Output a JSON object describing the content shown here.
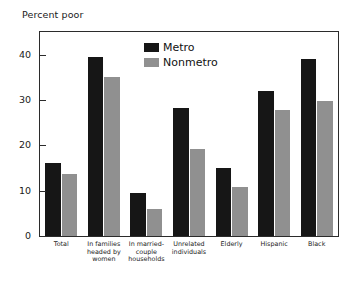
{
  "chart_data": {
    "type": "bar",
    "title": "Percent poor",
    "xlabel": "",
    "ylabel": "",
    "ylim": [
      0,
      45
    ],
    "yticks": [
      0,
      10,
      20,
      30,
      40
    ],
    "ytick_labels": [
      "0",
      "10",
      "20",
      "30",
      "40"
    ],
    "grid": false,
    "legend_position": "top-center",
    "categories": [
      "Total",
      "In families headed by women",
      "In married-couple households",
      "Unrelated individuals",
      "Elderly",
      "Hispanic",
      "Black"
    ],
    "category_lines": [
      [
        "Total"
      ],
      [
        "In families",
        "headed by",
        "women"
      ],
      [
        "In married-",
        "couple",
        "households"
      ],
      [
        "Unrelated",
        "individuals"
      ],
      [
        "Elderly"
      ],
      [
        "Hispanic"
      ],
      [
        "Black"
      ]
    ],
    "series": [
      {
        "name": "Metro",
        "color": "#161616",
        "values": [
          16.1,
          39.5,
          9.5,
          28.3,
          15.0,
          32.0,
          39.1
        ]
      },
      {
        "name": "Nonmetro",
        "color": "#909090",
        "values": [
          13.7,
          35.1,
          6.0,
          19.3,
          10.8,
          27.8,
          29.8
        ]
      }
    ]
  },
  "legend": {
    "items": [
      {
        "label": "Metro",
        "swatch": "metro"
      },
      {
        "label": "Nonmetro",
        "swatch": "nonmetro"
      }
    ]
  }
}
